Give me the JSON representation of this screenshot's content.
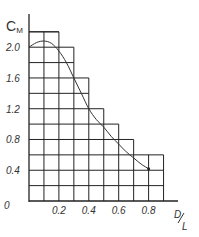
{
  "chart_data": {
    "type": "line",
    "title": "",
    "xlabel": "D/L",
    "ylabel": "C_M",
    "xlim": [
      0,
      0.9
    ],
    "ylim": [
      0,
      2.2
    ],
    "x_ticks": [
      "0.2",
      "0.4",
      "0.6",
      "0.8"
    ],
    "y_ticks": [
      "0",
      "0.4",
      "0.8",
      "1.2",
      "1.6",
      "2.0"
    ],
    "grid": true,
    "grid_envelope": {
      "description": "stepped grid outline (upper bound of gridded region)",
      "x": [
        0,
        0.2,
        0.3,
        0.4,
        0.5,
        0.6,
        0.7,
        0.9
      ],
      "top": [
        2.2,
        2.0,
        1.6,
        1.2,
        1.0,
        0.8,
        0.6
      ]
    },
    "series": [
      {
        "name": "C_M vs D/L",
        "x": [
          0.0,
          0.05,
          0.1,
          0.15,
          0.2,
          0.25,
          0.3,
          0.35,
          0.4,
          0.45,
          0.5,
          0.55,
          0.6,
          0.65,
          0.7,
          0.75,
          0.8
        ],
        "values": [
          2.0,
          2.06,
          2.08,
          2.05,
          1.95,
          1.8,
          1.6,
          1.4,
          1.2,
          1.06,
          0.96,
          0.84,
          0.74,
          0.64,
          0.56,
          0.48,
          0.42
        ]
      }
    ]
  },
  "labels": {
    "y_axis": "C",
    "y_axis_sub": "M",
    "x_axis_num": "D",
    "x_axis_den": "L",
    "origin": "0",
    "y_ticks": [
      "2.0",
      "1.6",
      "1.2",
      "0.8",
      "0.4"
    ],
    "x_ticks": [
      "0.2",
      "0.4",
      "0.6",
      "0.8"
    ]
  }
}
